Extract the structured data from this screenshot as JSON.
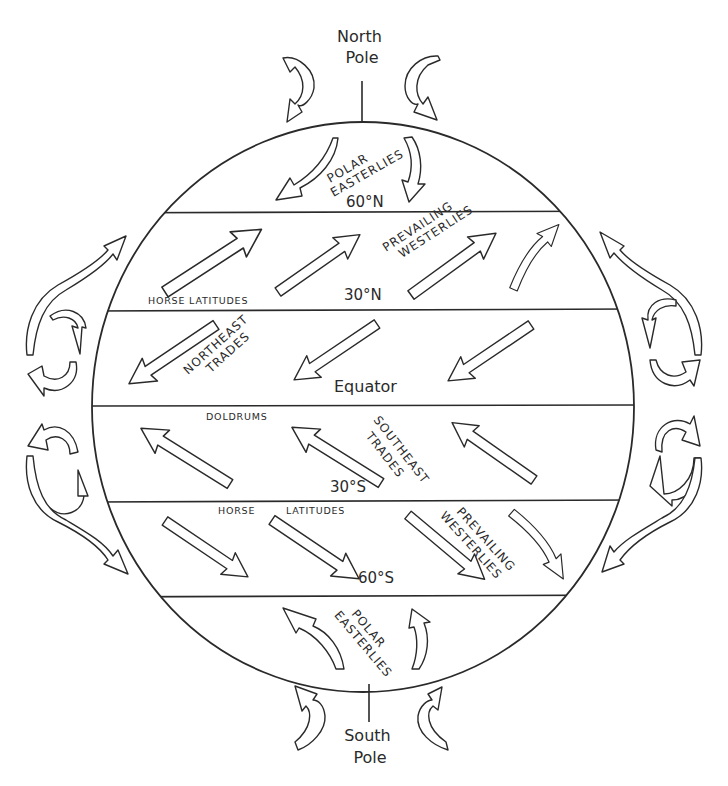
{
  "poles": {
    "north": [
      "North",
      "Pole"
    ],
    "south": [
      "South",
      "Pole"
    ]
  },
  "latitudes": {
    "n60": "60°N",
    "n30": "30°N",
    "equator": "Equator",
    "s30": "30°S",
    "s60": "60°S"
  },
  "zones": {
    "horse_latitudes": "HORSE LATITUDES",
    "horse_latitudes_south": [
      "HORSE",
      "LATITUDES"
    ],
    "doldrums": "DOLDRUMS"
  },
  "winds": {
    "polar_easterlies_north": [
      "POLAR",
      "EASTERLIES"
    ],
    "prevailing_westerlies_north": [
      "PREVAILING",
      "WESTERLIES"
    ],
    "northeast_trades": [
      "NORTHEAST",
      "TRADES"
    ],
    "southeast_trades": [
      "SOUTHEAST",
      "TRADES"
    ],
    "prevailing_westerlies_south": [
      "PREVAILING",
      "WESTERLIES"
    ],
    "polar_easterlies_south": [
      "POLAR",
      "EASTERLIES"
    ]
  },
  "colors": {
    "ink": "#2a2a2a",
    "background": "#ffffff"
  }
}
